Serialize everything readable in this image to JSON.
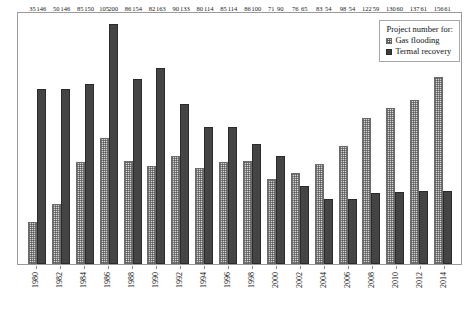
{
  "legend": {
    "title": "Project number for:",
    "entries": [
      {
        "label": "Gas flooding",
        "swatch": "hatched-light-square-icon",
        "color": "#d8d8d8"
      },
      {
        "label": "Termal recovery",
        "swatch": "solid-dark-square-icon",
        "color": "#444444"
      }
    ]
  },
  "chart_data": {
    "type": "bar",
    "title": "",
    "subtitle": "",
    "xlabel": "",
    "ylabel": "",
    "ylim": [
      0,
      210
    ],
    "grid": false,
    "legend_position": "top-right",
    "axis_tick_labels_y": [],
    "x_label_rotation_deg": 90,
    "categories": [
      "1980",
      "1982",
      "1984",
      "1986",
      "1988",
      "1990",
      "1992",
      "1994",
      "1996",
      "1998",
      "2000",
      "2002",
      "2004",
      "2006",
      "2008",
      "2010",
      "2012",
      "2014"
    ],
    "series": [
      {
        "name": "Gas flooding",
        "color": "#d8d8d8",
        "values": [
          35,
          50,
          85,
          105,
          86,
          82,
          90,
          80,
          85,
          86,
          71,
          76,
          83,
          98,
          122,
          130,
          137,
          156
        ]
      },
      {
        "name": "Termal recovery",
        "color": "#444444",
        "values": [
          146,
          146,
          150,
          200,
          154,
          163,
          133,
          114,
          114,
          100,
          90,
          65,
          54,
          54,
          59,
          60,
          61,
          61
        ]
      }
    ],
    "data_labels_shown": true
  }
}
